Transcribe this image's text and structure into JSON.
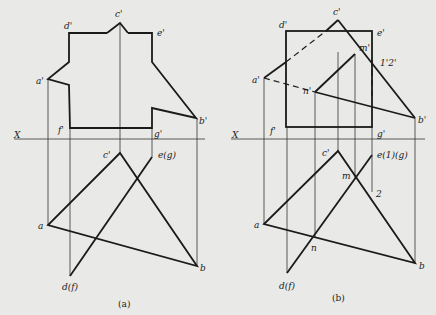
{
  "figure_a": {
    "caption": "(a)",
    "axis_label": "X",
    "labels": {
      "c_prime": "c'",
      "d_prime": "d'",
      "e_prime": "e'",
      "a_prime": "a'",
      "b_prime": "b'",
      "f_prime": "f'",
      "g_prime": "g'",
      "c": "c'",
      "e_g": "e(g)",
      "a": "a",
      "b": "b",
      "d_f": "d(f)"
    }
  },
  "figure_b": {
    "caption": "(b)",
    "axis_label": "X",
    "labels": {
      "c_prime": "c'",
      "d_prime": "d'",
      "e_prime": "e'",
      "m_prime": "m'",
      "one_two_prime": "1'2'",
      "a_prime": "a'",
      "n_prime": "n'",
      "b_prime": "b'",
      "f_prime": "f'",
      "g_prime": "g'",
      "c": "c'",
      "e_1_g": "e(1)(g)",
      "m": "m",
      "two": "2",
      "a": "a",
      "n": "n",
      "b": "b",
      "d_f": "d(f)"
    }
  }
}
